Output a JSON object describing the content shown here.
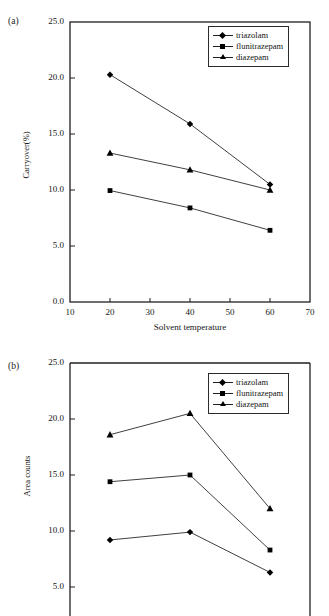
{
  "page": {
    "background": "#ffffff",
    "ink": "#111111"
  },
  "figures": [
    {
      "id": "a",
      "panel_label": "(a)",
      "legend_position": "top-right",
      "chart_data": {
        "type": "line",
        "title": "",
        "subtitle": "",
        "xlabel": "Solvent temperature",
        "ylabel": "Carryover(%)",
        "x": [
          20,
          40,
          60
        ],
        "xlim": [
          10,
          70
        ],
        "ylim": [
          0.0,
          25.0
        ],
        "xticks": [
          10,
          20,
          30,
          40,
          50,
          60,
          70
        ],
        "xtick_labels": [
          "10",
          "20",
          "30",
          "40",
          "50",
          "60",
          "70"
        ],
        "yticks": [
          0.0,
          5.0,
          10.0,
          15.0,
          20.0,
          25.0
        ],
        "ytick_labels": [
          "0.0",
          "5.0",
          "10.0",
          "15.0",
          "20.0",
          "25.0"
        ],
        "grid": false,
        "legend": [
          "triazolam",
          "flunitrazepam",
          "diazepam"
        ],
        "series": [
          {
            "name": "triazolam",
            "marker": "diamond",
            "values": [
              20.3,
              15.9,
              10.5
            ]
          },
          {
            "name": "flunitrazepam",
            "marker": "square",
            "values": [
              9.95,
              8.4,
              6.4
            ]
          },
          {
            "name": "diazepam",
            "marker": "triangle",
            "values": [
              13.3,
              11.8,
              10.0
            ]
          }
        ]
      }
    },
    {
      "id": "b",
      "panel_label": "(b)",
      "legend_position": "top-right",
      "chart_data": {
        "type": "line",
        "title": "",
        "subtitle": "",
        "xlabel": "",
        "ylabel": "Area counts",
        "x": [
          20,
          40,
          60
        ],
        "xlim": [
          10,
          70
        ],
        "ylim": [
          0.0,
          25.0
        ],
        "xticks": [],
        "xtick_labels": [],
        "yticks": [
          5.0,
          10.0,
          15.0,
          20.0,
          25.0
        ],
        "ytick_labels": [
          "5.0",
          "10.0",
          "15.0",
          "20.0",
          "25.0"
        ],
        "grid": false,
        "legend": [
          "triazolam",
          "flunitrazepam",
          "diazepam"
        ],
        "series": [
          {
            "name": "triazolam",
            "marker": "diamond",
            "values": [
              9.2,
              9.9,
              6.3
            ]
          },
          {
            "name": "flunitrazepam",
            "marker": "square",
            "values": [
              14.4,
              15.0,
              8.3
            ]
          },
          {
            "name": "diazepam",
            "marker": "triangle",
            "values": [
              18.6,
              20.5,
              12.0
            ]
          }
        ]
      }
    }
  ]
}
